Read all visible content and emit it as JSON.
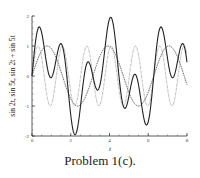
{
  "chart_data": {
    "type": "line",
    "title": "",
    "xlabel": "t",
    "ylabel": "sin 2t, sin 5t, sin 2t + sin 5t",
    "xlim": [
      0,
      8
    ],
    "ylim": [
      -2,
      2
    ],
    "xticks": [
      0,
      2,
      4,
      6,
      8
    ],
    "yticks": [
      -2,
      -1,
      0,
      1,
      2
    ],
    "grid": false,
    "legend": null,
    "series": [
      {
        "name": "sin 2t",
        "style": "dashed",
        "color": "#555555",
        "x": [
          0,
          0.5,
          1,
          1.5,
          2,
          2.5,
          3,
          3.5,
          4,
          4.5,
          5,
          5.5,
          6,
          6.5,
          7,
          7.5,
          8
        ],
        "values": [
          0,
          0.84,
          0.91,
          0.14,
          -0.76,
          -0.96,
          -0.28,
          0.66,
          0.99,
          0.41,
          -0.54,
          -1.0,
          -0.54,
          0.42,
          0.99,
          0.65,
          -0.29
        ]
      },
      {
        "name": "sin 5t",
        "style": "dotted",
        "color": "#888888",
        "x": [
          0,
          0.5,
          1,
          1.5,
          2,
          2.5,
          3,
          3.5,
          4,
          4.5,
          5,
          5.5,
          6,
          6.5,
          7,
          7.5,
          8
        ],
        "values": [
          0,
          0.6,
          -0.96,
          0.94,
          -0.54,
          -0.07,
          0.65,
          -0.98,
          0.91,
          -0.47,
          -0.13,
          0.71,
          -0.99,
          0.88,
          -0.43,
          -0.19,
          0.75
        ]
      },
      {
        "name": "sin 2t + sin 5t",
        "style": "solid",
        "color": "#222222",
        "x": [
          0,
          0.5,
          1,
          1.5,
          2,
          2.5,
          3,
          3.5,
          4,
          4.5,
          5,
          5.5,
          6,
          6.5,
          7,
          7.5,
          8
        ],
        "values": [
          0,
          1.44,
          -0.05,
          1.08,
          -1.3,
          -1.03,
          0.37,
          -0.32,
          1.9,
          -0.06,
          -0.67,
          -0.29,
          -1.53,
          1.3,
          0.56,
          0.46,
          0.46
        ]
      }
    ]
  },
  "caption": "Problem 1(c)."
}
